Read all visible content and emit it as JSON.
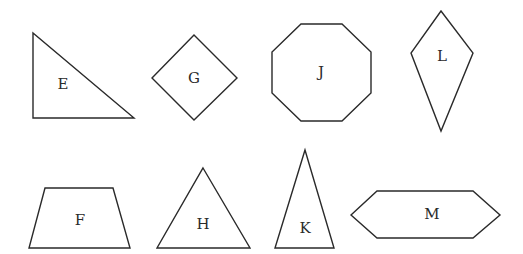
{
  "figure": {
    "shapes": [
      {
        "label": "E",
        "kind": "right-triangle",
        "points": "33,33 33,118 134,118",
        "label_pos": [
          63,
          84
        ]
      },
      {
        "label": "G",
        "kind": "square-rotated",
        "points": "194,35 237,78 194,120 152,78",
        "label_pos": [
          194,
          78
        ]
      },
      {
        "label": "J",
        "kind": "regular-octagon",
        "points": "301,24 342,24 371,52 371,93 342,121 301,121 272,93 272,52",
        "label_pos": [
          321,
          72
        ]
      },
      {
        "label": "L",
        "kind": "kite",
        "points": "441,11 473,53 441,131 411,53",
        "label_pos": [
          442,
          56
        ]
      },
      {
        "label": "F",
        "kind": "trapezoid",
        "points": "45,188 113,188 130,248 29,248",
        "label_pos": [
          80,
          220
        ]
      },
      {
        "label": "H",
        "kind": "equilateral-triangle",
        "points": "203,168 250,248 157,248",
        "label_pos": [
          203,
          224
        ]
      },
      {
        "label": "K",
        "kind": "isosceles-triangle",
        "points": "305,150 334,248 275,248",
        "label_pos": [
          305,
          228
        ]
      },
      {
        "label": "M",
        "kind": "hexagon",
        "points": "351,215 377,191 473,191 500,215 473,238 377,238",
        "label_pos": [
          432,
          214
        ]
      }
    ]
  }
}
